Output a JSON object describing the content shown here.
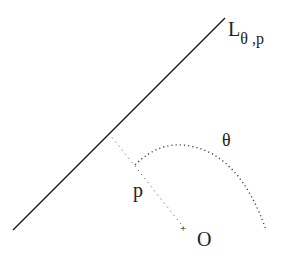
{
  "diagram": {
    "line_label": {
      "main": "L",
      "sub": "θ ,p"
    },
    "angle_label": "θ",
    "distance_label": "p",
    "origin_label": "O",
    "origin_marker": "+",
    "colors": {
      "line": "#111111",
      "dotted": "#555555",
      "text": "#222222",
      "background": "#ffffff"
    }
  }
}
